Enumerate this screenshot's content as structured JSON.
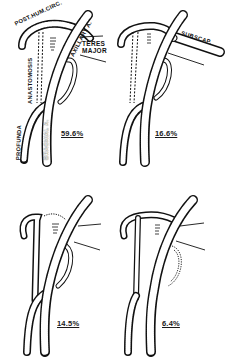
{
  "figure": {
    "panels": [
      {
        "id": "panel-1",
        "percentage": "59.6%",
        "labels": {
          "post_hum_circ": "POST.HUM.CIRC.",
          "axillary": "AXILLARY A.",
          "teres_major_line1": "TERES",
          "teres_major_line2": "MAJOR",
          "anastomosis": "ANASTOMOSIS",
          "profunda": "PROFUNDA",
          "brachial": "BRACHIAL A."
        }
      },
      {
        "id": "panel-2",
        "percentage": "16.6%",
        "labels": {
          "subscap": "SUBSCAP."
        }
      },
      {
        "id": "panel-3",
        "percentage": "14.5%"
      },
      {
        "id": "panel-4",
        "percentage": "6.4%"
      }
    ],
    "colors": {
      "ink": "#111111",
      "background": "#ffffff"
    }
  }
}
